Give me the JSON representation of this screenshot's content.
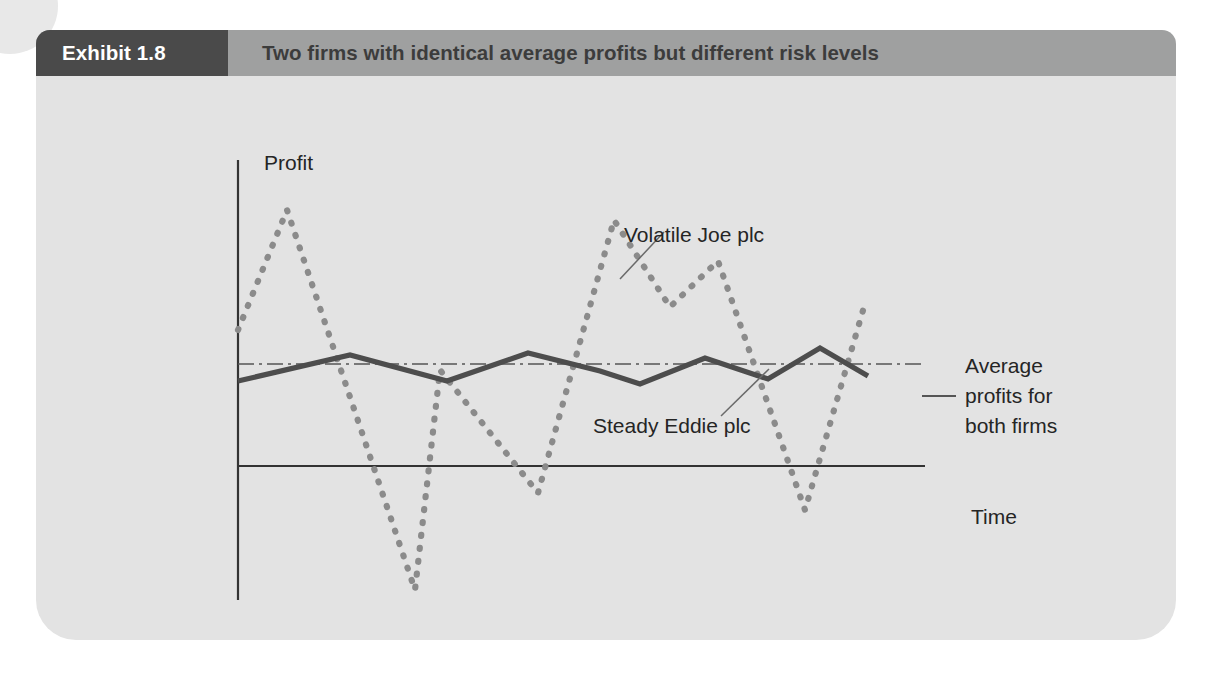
{
  "exhibit": {
    "badge_label": "Exhibit 1.8",
    "title": "Two firms with identical average profits but different risk levels",
    "badge_color": "#4a4a4a",
    "header_color": "#9fa0a0",
    "panel_color": "#e3e3e3"
  },
  "chart_data": {
    "type": "line",
    "title": "Two firms with identical average profits but different risk levels",
    "xlabel": "Time",
    "ylabel": "Profit",
    "y_axis_top_label": "Profit",
    "y_axis_bottom_label": "Loss",
    "grid": false,
    "legend_position": "annotations",
    "axes": {
      "x_axis_y_pixel": 466,
      "y_axis_x_pixel": 238,
      "y_axis_top_pixel": 160,
      "y_axis_bottom_pixel": 600,
      "x_axis_right_pixel": 925
    },
    "annotations": [
      {
        "name": "volatile-joe-label",
        "text": "Volatile Joe plc",
        "x": 588,
        "y": 212
      },
      {
        "name": "steady-eddie-label",
        "text": "Steady Eddie plc",
        "x": 557,
        "y": 403
      },
      {
        "name": "average-line-label",
        "line1": "Average",
        "line2": "profits for",
        "line3": "both firms",
        "x": 929,
        "y": 336
      },
      {
        "name": "time-axis-label",
        "text": "Time",
        "x": 935,
        "y": 494
      },
      {
        "name": "profit-axis-label",
        "text": "Profit",
        "x": 228,
        "y": 140
      },
      {
        "name": "loss-axis-label",
        "text": "Loss",
        "x": 228,
        "y": 626
      }
    ],
    "series": [
      {
        "name": "Volatile Joe plc",
        "style": "dotted",
        "color": "#8b8b8b",
        "points": [
          [
            238,
            330
          ],
          [
            287,
            210
          ],
          [
            415,
            590
          ],
          [
            440,
            370
          ],
          [
            538,
            493
          ],
          [
            614,
            220
          ],
          [
            670,
            307
          ],
          [
            718,
            261
          ],
          [
            805,
            510
          ],
          [
            866,
            300
          ]
        ]
      },
      {
        "name": "Steady Eddie plc",
        "style": "solid",
        "color": "#4d4d4d",
        "points": [
          [
            238,
            381
          ],
          [
            350,
            355
          ],
          [
            447,
            381
          ],
          [
            528,
            353
          ],
          [
            600,
            371
          ],
          [
            640,
            384
          ],
          [
            705,
            358
          ],
          [
            768,
            379
          ],
          [
            820,
            348
          ],
          [
            868,
            376
          ]
        ]
      },
      {
        "name": "Average profits for both firms",
        "style": "dash-dot",
        "color": "#555555",
        "points": [
          [
            238,
            364
          ],
          [
            925,
            364
          ]
        ]
      }
    ]
  }
}
